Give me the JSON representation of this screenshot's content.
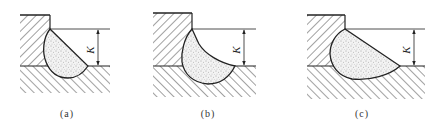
{
  "diagram": {
    "type": "fillet-weld-profiles",
    "colors": {
      "stroke": "#222222",
      "hatch": "#444444",
      "weld_fill": "#f2f2f2",
      "weld_dots": "#555555",
      "background": "#ffffff"
    },
    "panels": [
      {
        "id": "a",
        "caption": "(a)",
        "dimension_label": "K",
        "profile": "convex-flat"
      },
      {
        "id": "b",
        "caption": "(b)",
        "dimension_label": "K",
        "profile": "concave"
      },
      {
        "id": "c",
        "caption": "(c)",
        "dimension_label": "K",
        "profile": "flat-elongated"
      }
    ]
  }
}
